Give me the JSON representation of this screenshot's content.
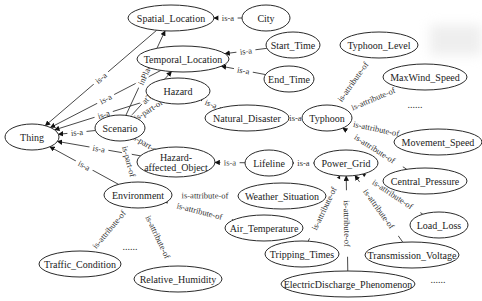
{
  "diagram": {
    "nodes": [
      {
        "id": "thing",
        "label": "Thing",
        "x": 32,
        "y": 137,
        "rx": 27,
        "ry": 13
      },
      {
        "id": "scenario",
        "label": "Scenario",
        "x": 120,
        "y": 128,
        "rx": 25,
        "ry": 13
      },
      {
        "id": "environment",
        "label": "Environment",
        "x": 138,
        "y": 195,
        "rx": 34,
        "ry": 13
      },
      {
        "id": "spatial_location",
        "label": "Spatial_Location",
        "x": 171,
        "y": 18,
        "rx": 43,
        "ry": 13
      },
      {
        "id": "city",
        "label": "City",
        "x": 266,
        "y": 18,
        "rx": 24,
        "ry": 13
      },
      {
        "id": "temporal_location",
        "label": "Temporal_Location",
        "x": 183,
        "y": 59,
        "rx": 46,
        "ry": 13
      },
      {
        "id": "start_time",
        "label": "Start_Time",
        "x": 293,
        "y": 45,
        "rx": 27,
        "ry": 13
      },
      {
        "id": "end_time",
        "label": "End_Time",
        "x": 289,
        "y": 79,
        "rx": 25,
        "ry": 13
      },
      {
        "id": "hazard",
        "label": "Hazard",
        "x": 178,
        "y": 91,
        "rx": 32,
        "ry": 13
      },
      {
        "id": "natural_disaster",
        "label": "Natural_Disaster",
        "x": 247,
        "y": 118,
        "rx": 42,
        "ry": 13
      },
      {
        "id": "typhoon",
        "label": "Typhoon",
        "x": 327,
        "y": 118,
        "rx": 25,
        "ry": 13
      },
      {
        "id": "typhoon_level",
        "label": "Typhoon_Level",
        "x": 379,
        "y": 45,
        "rx": 39,
        "ry": 13
      },
      {
        "id": "maxwind_speed",
        "label": "MaxWind_Speed",
        "x": 425,
        "y": 77,
        "rx": 42,
        "ry": 13
      },
      {
        "id": "movement_speed",
        "label": "Movement_Speed",
        "x": 438,
        "y": 142,
        "rx": 44,
        "ry": 13
      },
      {
        "id": "central_pressure",
        "label": "Central_Pressure",
        "x": 425,
        "y": 181,
        "rx": 42,
        "ry": 13
      },
      {
        "id": "hazard_affected_object",
        "label": "Hazard-\naffected_Object",
        "x": 176,
        "y": 162,
        "rx": 39,
        "ry": 15
      },
      {
        "id": "lifeline",
        "label": "Lifeline",
        "x": 269,
        "y": 163,
        "rx": 24,
        "ry": 13
      },
      {
        "id": "power_grid",
        "label": "Power_Grid",
        "x": 346,
        "y": 163,
        "rx": 32,
        "ry": 13
      },
      {
        "id": "weather_situation",
        "label": "Weather_Situation",
        "x": 282,
        "y": 196,
        "rx": 44,
        "ry": 13
      },
      {
        "id": "air_temperature",
        "label": "Air_Temperature",
        "x": 264,
        "y": 228,
        "rx": 39,
        "ry": 13
      },
      {
        "id": "traffic_condition",
        "label": "Traffic_Condition",
        "x": 80,
        "y": 264,
        "rx": 41,
        "ry": 13
      },
      {
        "id": "relative_humidity",
        "label": "Relative_Humidity",
        "x": 178,
        "y": 279,
        "rx": 44,
        "ry": 13
      },
      {
        "id": "load_loss",
        "label": "Load_Loss",
        "x": 439,
        "y": 225,
        "rx": 29,
        "ry": 13
      },
      {
        "id": "transmission_voltage",
        "label": "Transmission_Voltage",
        "x": 412,
        "y": 255,
        "rx": 47,
        "ry": 13
      },
      {
        "id": "tripping_times",
        "label": "Tripping_Times",
        "x": 302,
        "y": 254,
        "rx": 37,
        "ry": 13
      },
      {
        "id": "electricdischarge_phenomenon",
        "label": "ElectricDischarge_Phenomenon",
        "x": 348,
        "y": 284,
        "rx": 67,
        "ry": 13
      }
    ],
    "edges": [
      {
        "from": "scenario",
        "to": "thing",
        "label": "is-a"
      },
      {
        "from": "spatial_location",
        "to": "thing",
        "label": "is-a"
      },
      {
        "from": "temporal_location",
        "to": "thing",
        "label": "is-a"
      },
      {
        "from": "hazard",
        "to": "thing",
        "label": "is-a"
      },
      {
        "from": "hazard_affected_object",
        "to": "thing",
        "label": "is-a"
      },
      {
        "from": "environment",
        "to": "thing",
        "label": "is-a"
      },
      {
        "from": "scenario",
        "to": "spatial_location",
        "label": "inPlace"
      },
      {
        "from": "scenario",
        "to": "temporal_location",
        "label": "atTime"
      },
      {
        "from": "city",
        "to": "spatial_location",
        "label": "is-a"
      },
      {
        "from": "start_time",
        "to": "temporal_location",
        "label": "is-a"
      },
      {
        "from": "end_time",
        "to": "temporal_location",
        "label": "is-a"
      },
      {
        "from": "hazard",
        "to": "scenario",
        "label": "is-part-of"
      },
      {
        "from": "hazard_affected_object",
        "to": "scenario",
        "label": "is-part-of"
      },
      {
        "from": "environment",
        "to": "scenario",
        "label": "is-part-of"
      },
      {
        "from": "natural_disaster",
        "to": "hazard",
        "label": "is-a"
      },
      {
        "from": "typhoon",
        "to": "natural_disaster",
        "label": "is-a"
      },
      {
        "from": "typhoon_level",
        "to": "typhoon",
        "label": "is-attribute-of"
      },
      {
        "from": "maxwind_speed",
        "to": "typhoon",
        "label": "is-attribute-of"
      },
      {
        "from": "movement_speed",
        "to": "typhoon",
        "label": "is-attribute-of"
      },
      {
        "from": "central_pressure",
        "to": "typhoon",
        "label": "is-attribute-of"
      },
      {
        "from": "lifeline",
        "to": "hazard_affected_object",
        "label": "is-a"
      },
      {
        "from": "power_grid",
        "to": "lifeline",
        "label": "is-a"
      },
      {
        "from": "weather_situation",
        "to": "environment",
        "label": "is-attribute-of"
      },
      {
        "from": "air_temperature",
        "to": "environment",
        "label": "is-attribute-of"
      },
      {
        "from": "traffic_condition",
        "to": "environment",
        "label": "is-attribute-of"
      },
      {
        "from": "relative_humidity",
        "to": "environment",
        "label": "is-attribute-of"
      },
      {
        "from": "load_loss",
        "to": "power_grid",
        "label": "is-attribute-of"
      },
      {
        "from": "transmission_voltage",
        "to": "power_grid",
        "label": "is-attribute-of"
      },
      {
        "from": "tripping_times",
        "to": "power_grid",
        "label": "is-attribute-of"
      },
      {
        "from": "electricdischarge_phenomenon",
        "to": "power_grid",
        "label": "is-attribute-of"
      }
    ],
    "ellipses": [
      {
        "text": "......",
        "x": 415,
        "y": 108
      },
      {
        "text": "......",
        "x": 130,
        "y": 250
      },
      {
        "text": "......",
        "x": 438,
        "y": 283
      }
    ]
  }
}
